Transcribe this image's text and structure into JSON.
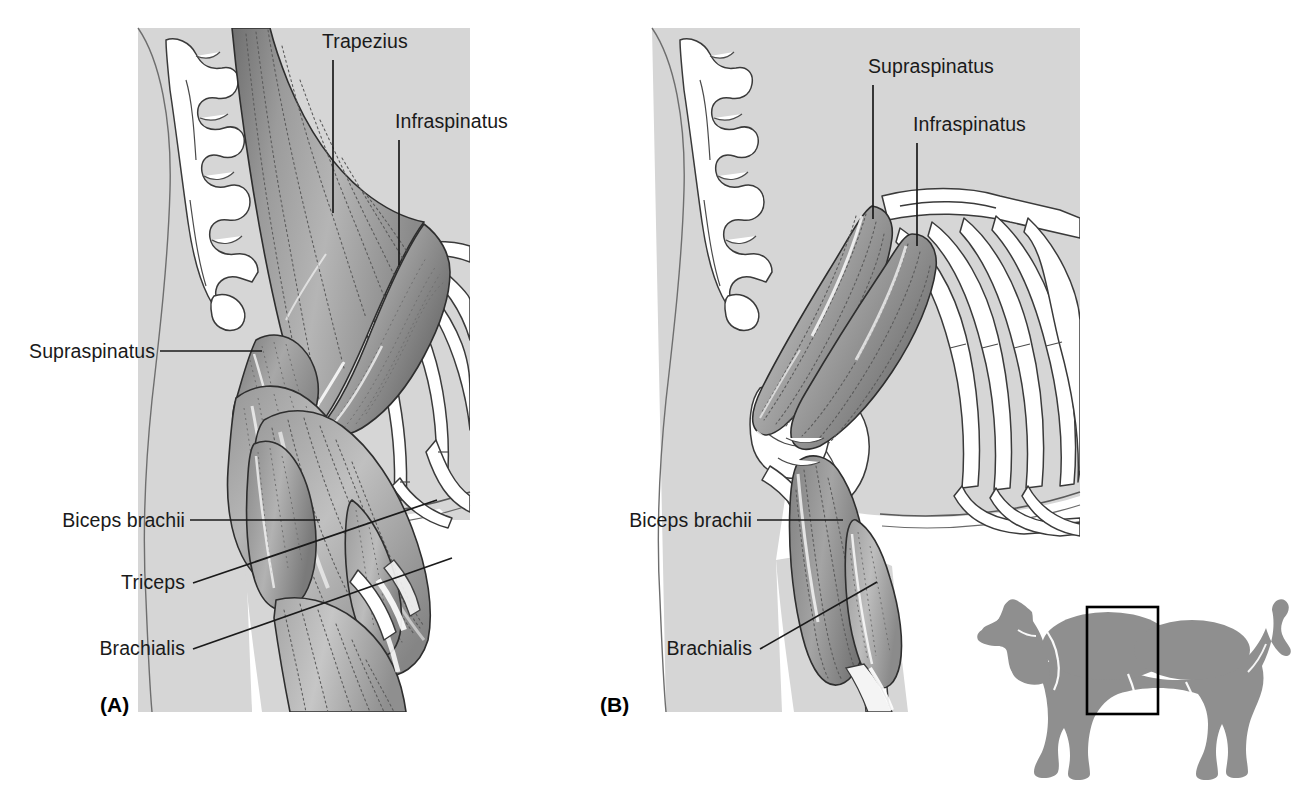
{
  "figure": {
    "panels": [
      {
        "id": "panel-a",
        "caption": "(A)",
        "caption_x": 100,
        "caption_y": 712,
        "description": "Superficial muscles of the canine shoulder and brachium",
        "labels": [
          {
            "name": "trapezius",
            "text": "Trapezius",
            "x": 322,
            "y": 48,
            "anchor": "start",
            "leader": "M 333,60 L 333,213"
          },
          {
            "name": "infraspinatus",
            "text": "Infraspinatus",
            "x": 395,
            "y": 128,
            "anchor": "start",
            "leader": "M 399,140 L 399,265"
          },
          {
            "name": "supraspinatus",
            "text": "Supraspinatus",
            "x": 155,
            "y": 358,
            "anchor": "end",
            "leader": "M 160,351 L 262,351"
          },
          {
            "name": "biceps-brachii",
            "text": "Biceps brachii",
            "x": 185,
            "y": 527,
            "anchor": "end",
            "leader": "M 190,520 L 320,520"
          },
          {
            "name": "triceps",
            "text": "Triceps",
            "x": 185,
            "y": 589,
            "anchor": "end",
            "leader": "M 193,583 L 437,500"
          },
          {
            "name": "brachialis",
            "text": "Brachialis",
            "x": 185,
            "y": 655,
            "anchor": "end",
            "leader": "M 193,649 L 452,558"
          }
        ]
      },
      {
        "id": "panel-b",
        "caption": "(B)",
        "caption_x": 600,
        "caption_y": 712,
        "description": "Deep muscles of the canine shoulder and brachium",
        "labels": [
          {
            "name": "supraspinatus",
            "text": "Supraspinatus",
            "x": 868,
            "y": 73,
            "anchor": "start",
            "leader": "M 873,85 L 873,219"
          },
          {
            "name": "infraspinatus",
            "text": "Infraspinatus",
            "x": 913,
            "y": 131,
            "anchor": "start",
            "leader": "M 917,143 L 917,246"
          },
          {
            "name": "biceps-brachii",
            "text": "Biceps brachii",
            "x": 752,
            "y": 527,
            "anchor": "end",
            "leader": "M 757,520 L 843,520"
          },
          {
            "name": "brachialis",
            "text": "Brachialis",
            "x": 752,
            "y": 655,
            "anchor": "end",
            "leader": "M 760,649 L 877,582"
          }
        ]
      }
    ],
    "inset": {
      "name": "dog-orientation-inset",
      "description": "Gray dog silhouette with black rectangle over shoulder region",
      "box": {
        "x": 1087,
        "y": 607,
        "width": 71,
        "height": 107
      }
    },
    "colors": {
      "background": "#ffffff",
      "body_fill": "#d6d6d6",
      "bone_fill": "#ffffff",
      "bone_stroke": "#3a3a3a",
      "muscle_light": "#b9b9b9",
      "muscle_mid": "#9a9a9a",
      "muscle_dark": "#7d7d7d",
      "fiber_line": "#5a5a5a",
      "label_text": "#1a1a1a",
      "dog_silhouette": "#8f8f8f",
      "inset_box": "#000000"
    }
  }
}
